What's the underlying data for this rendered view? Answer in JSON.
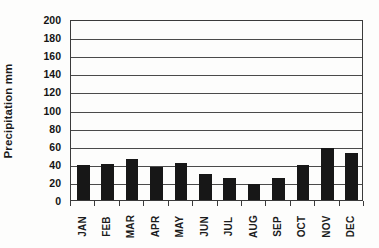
{
  "chart_data": {
    "type": "bar",
    "title": "",
    "xlabel": "",
    "ylabel": "Precipitation mm",
    "categories": [
      "JAN",
      "FEB",
      "MAR",
      "APR",
      "MAY",
      "JUN",
      "JUL",
      "AUG",
      "SEP",
      "OCT",
      "NOV",
      "DEC"
    ],
    "values": [
      39,
      40,
      45,
      36,
      41,
      29,
      24,
      18,
      24,
      39,
      58,
      52
    ],
    "series": [
      {
        "name": "Precipitation",
        "values": [
          39,
          40,
          45,
          36,
          41,
          29,
          24,
          18,
          24,
          39,
          58,
          52
        ]
      }
    ],
    "ylim": [
      0,
      200
    ],
    "ytick_step": 20,
    "ytick_labels": [
      "0",
      "20",
      "40",
      "60",
      "80",
      "100",
      "120",
      "140",
      "160",
      "180",
      "200"
    ],
    "ytick_values": [
      0,
      20,
      40,
      60,
      80,
      100,
      120,
      140,
      160,
      180,
      200
    ],
    "grid": true,
    "grid_axis": "y",
    "legend": false,
    "legend_position": "none",
    "bar_color": "#171717",
    "axis_color": "#3b3b3b",
    "grid_color": "#4a4a4a",
    "background_color": "#fdfdfc",
    "annotations": []
  }
}
